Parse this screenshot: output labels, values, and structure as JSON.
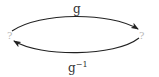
{
  "diagram": {
    "nodes": [
      {
        "id": "left",
        "label": "?"
      },
      {
        "id": "right",
        "label": "?"
      }
    ],
    "edges": [
      {
        "from": "left",
        "to": "right",
        "label": "g",
        "position": "top"
      },
      {
        "from": "right",
        "to": "left",
        "label": "g",
        "superscript": "−1",
        "position": "bottom"
      }
    ],
    "colors": {
      "stroke": "#222222",
      "node_label": "#b8b8b8",
      "edge_label": "#333333"
    }
  }
}
